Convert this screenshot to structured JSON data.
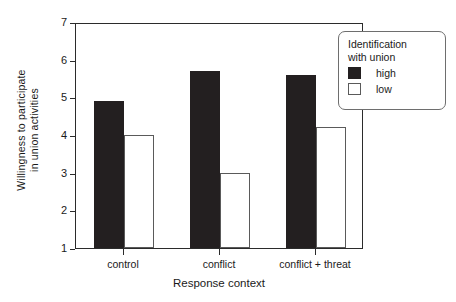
{
  "chart_data": {
    "type": "bar",
    "title": "",
    "xlabel": "Response context",
    "ylabel_line1": "Willingness to participate",
    "ylabel_line2": "in union activities",
    "categories": [
      "control",
      "conflict",
      "conflict + threat"
    ],
    "series": [
      {
        "name": "high",
        "color": "#231f20",
        "values": [
          4.9,
          5.7,
          5.6
        ]
      },
      {
        "name": "low",
        "color": "#ffffff",
        "values": [
          4.0,
          3.0,
          4.2
        ]
      }
    ],
    "ylim": [
      1,
      7
    ],
    "yticks": [
      1,
      2,
      3,
      4,
      5,
      6,
      7
    ],
    "ytick_labels": [
      "1",
      "2",
      "3",
      "4",
      "5",
      "6",
      "7"
    ],
    "grid": false,
    "legend": {
      "position": "top-right",
      "title_line1": "Identification",
      "title_line2": "with union",
      "entries": [
        {
          "label": "high",
          "swatch": "filled-black-square"
        },
        {
          "label": "low",
          "swatch": "open-white-square"
        }
      ]
    }
  }
}
